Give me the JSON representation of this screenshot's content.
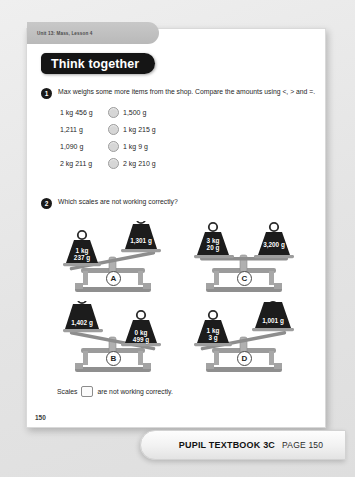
{
  "page": {
    "unit_tab": "Unit 13: Mass, Lesson 4",
    "banner_title": "Think together",
    "page_number": "150"
  },
  "questions": [
    {
      "number": "1",
      "text": "Max weighs some more items from the shop. Compare the amounts using <, > and =.",
      "comparisons": [
        {
          "left": "1 kg 456 g",
          "right": "1,500 g"
        },
        {
          "left": "1,211 g",
          "right": "1 kg 215 g"
        },
        {
          "left": "1,090 g",
          "right": "1 kg 9 g"
        },
        {
          "left": "2 kg 211 g",
          "right": "2 kg 210 g"
        }
      ]
    },
    {
      "number": "2",
      "text": "Which scales are not working correctly?"
    }
  ],
  "scales": [
    {
      "letter": "A",
      "left_weight": "1 kg\n237 g",
      "right_weight": "1,301 g",
      "tilt": "right-up"
    },
    {
      "letter": "C",
      "left_weight": "3 kg\n20 g",
      "right_weight": "3,200 g",
      "tilt": "level"
    },
    {
      "letter": "B",
      "left_weight": "1,402 g",
      "right_weight": "0 kg\n499 g",
      "tilt": "left-up"
    },
    {
      "letter": "D",
      "left_weight": "1 kg\n3 g",
      "right_weight": "1,001 g",
      "tilt": "right-up"
    }
  ],
  "answer": {
    "prefix": "Scales",
    "suffix": "are not working correctly."
  },
  "footer": {
    "book": "PUPIL TEXTBOOK 3C",
    "page_label": "PAGE 150"
  },
  "colors": {
    "banner_bg": "#151515",
    "weight_fill": "#1c1c1c",
    "scale_body": "#9a9a9a",
    "page_bg": "#ffffff"
  }
}
